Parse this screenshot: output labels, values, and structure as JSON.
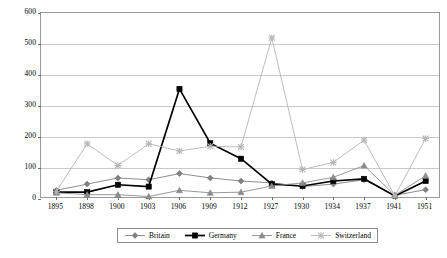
{
  "chart_data": {
    "type": "line",
    "title": "",
    "xlabel": "",
    "ylabel": "",
    "ylim": [
      0,
      600
    ],
    "ytick_labels": [
      "0",
      "100",
      "200",
      "300",
      "400",
      "500",
      "600"
    ],
    "yticks": [
      0,
      100,
      200,
      300,
      400,
      500,
      600
    ],
    "grid": "horizontal",
    "legend_position": "bottom",
    "categories": [
      "1895",
      "1898",
      "1900",
      "1903",
      "1906",
      "1909",
      "1912",
      "1927",
      "1930",
      "1934",
      "1937",
      "1941",
      "1951"
    ],
    "series": [
      {
        "name": "Britain",
        "marker": "diamond",
        "color": "#808080",
        "values": [
          28,
          48,
          68,
          62,
          82,
          68,
          58,
          52,
          40,
          48,
          62,
          12,
          30
        ]
      },
      {
        "name": "Germany",
        "marker": "square",
        "color": "#000000",
        "values": [
          22,
          22,
          46,
          40,
          355,
          180,
          130,
          48,
          42,
          58,
          65,
          10,
          58
        ]
      },
      {
        "name": "France",
        "marker": "triangle",
        "color": "#8c8c8c",
        "values": [
          20,
          14,
          14,
          8,
          28,
          20,
          22,
          42,
          52,
          70,
          108,
          12,
          75
        ]
      },
      {
        "name": "Switzerland",
        "marker": "star",
        "color": "#b5b5b5",
        "values": [
          25,
          178,
          108,
          178,
          155,
          170,
          168,
          520,
          95,
          118,
          190,
          10,
          195
        ]
      }
    ]
  },
  "legend": {
    "items": [
      {
        "label": "Britain"
      },
      {
        "label": "Germany"
      },
      {
        "label": "France"
      },
      {
        "label": "Switzerland"
      }
    ]
  }
}
